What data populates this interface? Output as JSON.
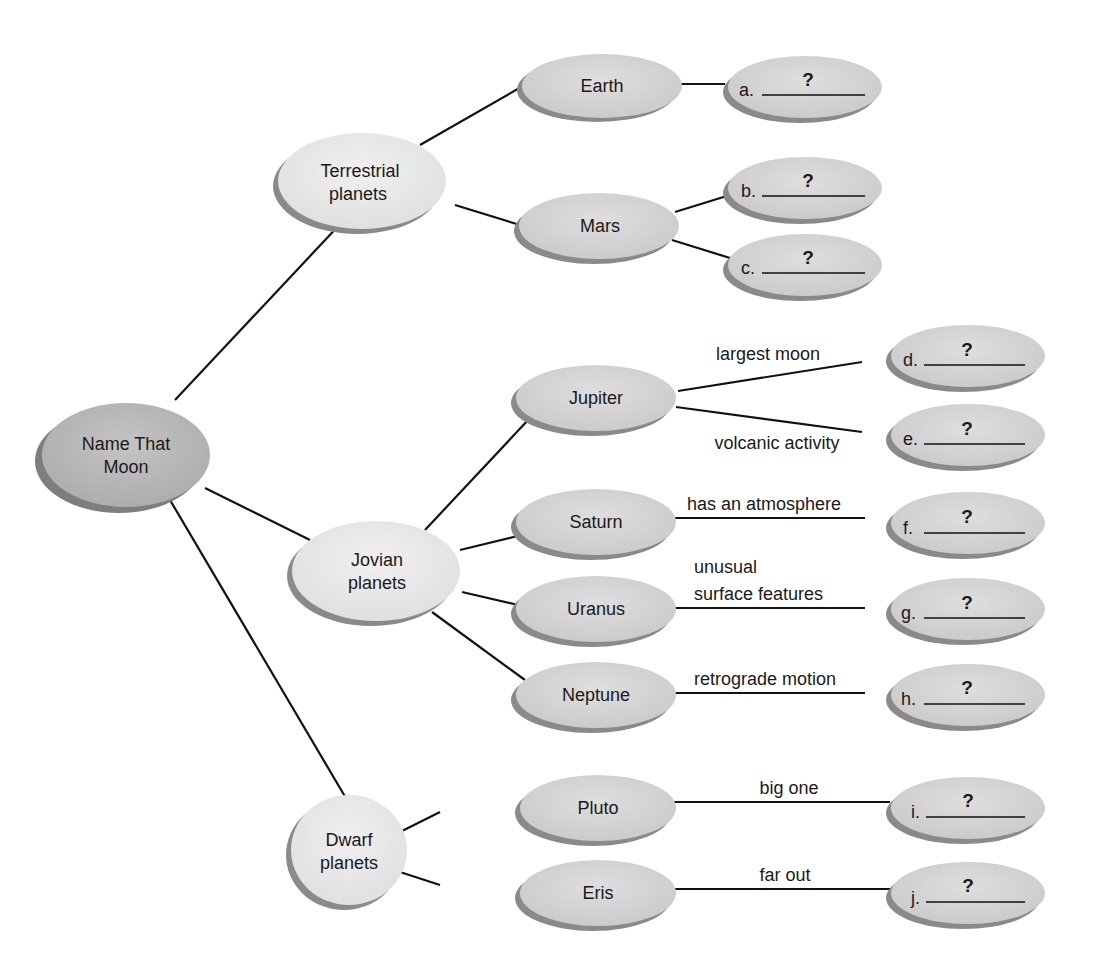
{
  "root": {
    "lines": [
      "Name That",
      "Moon"
    ]
  },
  "categories": [
    {
      "id": "terrestrial",
      "lines": [
        "Terrestrial",
        "planets"
      ]
    },
    {
      "id": "jovian",
      "lines": [
        "Jovian",
        "planets"
      ]
    },
    {
      "id": "dwarf",
      "lines": [
        "Dwarf",
        "planets"
      ]
    }
  ],
  "planets": [
    {
      "id": "earth",
      "label": "Earth"
    },
    {
      "id": "mars",
      "label": "Mars"
    },
    {
      "id": "jupiter",
      "label": "Jupiter"
    },
    {
      "id": "saturn",
      "label": "Saturn"
    },
    {
      "id": "uranus",
      "label": "Uranus"
    },
    {
      "id": "neptune",
      "label": "Neptune"
    },
    {
      "id": "pluto",
      "label": "Pluto"
    },
    {
      "id": "eris",
      "label": "Eris"
    }
  ],
  "answers": [
    {
      "letter": "a.",
      "mark": "?"
    },
    {
      "letter": "b.",
      "mark": "?"
    },
    {
      "letter": "c.",
      "mark": "?"
    },
    {
      "letter": "d.",
      "mark": "?"
    },
    {
      "letter": "e.",
      "mark": "?"
    },
    {
      "letter": "f.",
      "mark": "?"
    },
    {
      "letter": "g.",
      "mark": "?"
    },
    {
      "letter": "h.",
      "mark": "?"
    },
    {
      "letter": "i.",
      "mark": "?"
    },
    {
      "letter": "j.",
      "mark": "?"
    }
  ],
  "edge_labels": {
    "jupiter_d": "largest moon",
    "jupiter_e": "volcanic activity",
    "saturn_f": "has an atmosphere",
    "uranus_g_1": "unusual",
    "uranus_g_2": "surface features",
    "neptune_h": "retrograde motion",
    "pluto_i": "big one",
    "eris_j": "far out"
  },
  "colors": {
    "root_fill": "#b5b5b5",
    "category_fill": "#e8e8e8",
    "planet_fill": "#d4d4d4",
    "answer_fill": "#d4d4d4",
    "shadow": "#8a8a8a",
    "line": "#111111"
  }
}
